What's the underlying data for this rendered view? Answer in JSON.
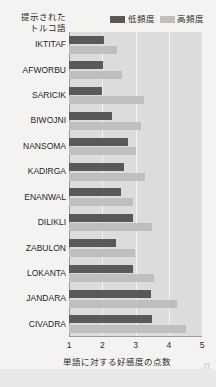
{
  "legend": {
    "items": [
      {
        "label": "低頻度",
        "color": "#595959",
        "name": "legend-low-frequency"
      },
      {
        "label": "高頻度",
        "color": "#bfbfbf",
        "name": "legend-high-frequency"
      }
    ]
  },
  "axis_header": {
    "line1": "提示された",
    "line2": "トルコ語"
  },
  "xaxis": {
    "label": "単語に対する好感度の点数",
    "ticks": [
      "1",
      "2",
      "3",
      "4",
      "5"
    ]
  },
  "watermark": "n",
  "chart_data": {
    "type": "bar",
    "orientation": "horizontal",
    "title": "",
    "xlabel": "単語に対する好感度の点数",
    "ylabel": "提示されたトルコ語",
    "xlim": [
      1,
      5
    ],
    "grid": true,
    "legend_position": "top-right",
    "categories": [
      "IKTITAF",
      "AFWORBU",
      "SARICIK",
      "BIWOJNI",
      "NANSOMA",
      "KADIRGA",
      "ENANWAL",
      "DILIKLI",
      "ZABULON",
      "LOKANTA",
      "JANDARA",
      "CIVADRA"
    ],
    "series": [
      {
        "name": "低頻度",
        "color": "#595959",
        "values": [
          2.05,
          2.02,
          1.99,
          2.29,
          2.77,
          2.65,
          2.56,
          2.92,
          2.41,
          2.92,
          3.46,
          3.5
        ]
      },
      {
        "name": "高頻度",
        "color": "#bfbfbf",
        "values": [
          2.44,
          2.59,
          3.25,
          3.17,
          3.02,
          3.29,
          2.92,
          3.5,
          2.99,
          3.56,
          4.25,
          4.52
        ]
      }
    ]
  }
}
